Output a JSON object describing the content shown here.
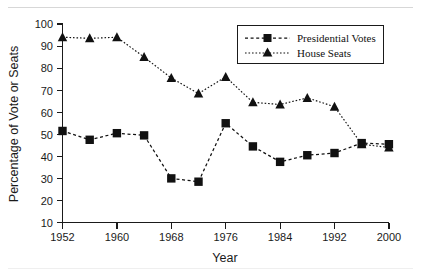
{
  "chart_data": {
    "type": "line",
    "title": "",
    "xlabel": "Year",
    "ylabel": "Percentage of Vote or Seats",
    "xlim": [
      1952,
      2000
    ],
    "ylim": [
      10,
      100
    ],
    "grid": false,
    "legend_position": "top-right",
    "xticks": [
      1952,
      1960,
      1968,
      1976,
      1984,
      1992,
      2000
    ],
    "xtick_labels": [
      "1952",
      "1960",
      "1968",
      "1976",
      "1984",
      "1992",
      "2000"
    ],
    "yticks": [
      10,
      20,
      30,
      40,
      50,
      60,
      70,
      80,
      90,
      100
    ],
    "ytick_labels": [
      "10",
      "20",
      "30",
      "40",
      "50",
      "60",
      "70",
      "80",
      "90",
      "100"
    ],
    "x": [
      1952,
      1956,
      1960,
      1964,
      1968,
      1972,
      1976,
      1980,
      1984,
      1988,
      1992,
      1996,
      2000
    ],
    "series": [
      {
        "name": "Presidential Votes",
        "marker": "square",
        "linestyle": "dashed",
        "color": "#111111",
        "values": [
          51.5,
          47.5,
          50.5,
          49.5,
          30.0,
          28.5,
          55.0,
          44.5,
          37.5,
          40.5,
          41.5,
          46.0,
          45.5
        ]
      },
      {
        "name": "House Seats",
        "marker": "triangle",
        "linestyle": "dotted",
        "color": "#111111",
        "values": [
          94.0,
          93.5,
          94.0,
          85.0,
          75.5,
          68.5,
          76.0,
          64.5,
          63.5,
          66.5,
          62.5,
          45.5,
          44.0
        ]
      }
    ]
  },
  "legend": {
    "entries": [
      {
        "label": "Presidential Votes",
        "marker": "square"
      },
      {
        "label": "House Seats",
        "marker": "triangle"
      }
    ]
  }
}
